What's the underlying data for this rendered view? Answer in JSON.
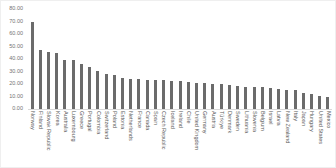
{
  "chart_data": {
    "type": "bar",
    "title": "",
    "xlabel": "",
    "ylabel": "",
    "ylim": [
      0,
      80
    ],
    "ytick_step": 10,
    "ytick_labels": [
      "0.00",
      "10.00",
      "20.00",
      "30.00",
      "40.00",
      "50.00",
      "60.00",
      "70.00",
      "80.00"
    ],
    "grid": false,
    "legend": false,
    "bar_color": "#6b6b6b",
    "axis_tick_color": "#737373",
    "category_label_color": "#595959",
    "categories": [
      "Norway",
      "Finland",
      "Slovak Republic",
      "Korea",
      "Australia",
      "Luxembourg",
      "Greece",
      "Portugal",
      "Colombia",
      "Switzerland",
      "Poland",
      "Estonia",
      "Netherlands",
      "France",
      "Canada",
      "Spain",
      "Czech Republic",
      "Iceland",
      "Ireland",
      "Chile",
      "United Kingdom",
      "Germany",
      "Austria",
      "Türkiye",
      "Denmark",
      "Sweden",
      "Lithuania",
      "Slovenia",
      "Belgium",
      "Israel",
      "Latvia",
      "New Zealand",
      "Italy",
      "Japan",
      "Hungary",
      "United States",
      "Mexico"
    ],
    "values": [
      69.5,
      47.3,
      45.7,
      44.8,
      39.6,
      39.2,
      35.8,
      33.6,
      30.4,
      28.0,
      27.3,
      25.1,
      24.3,
      24.2,
      23.6,
      23.3,
      23.0,
      22.4,
      22.2,
      21.6,
      21.1,
      20.6,
      20.3,
      20.0,
      19.2,
      18.6,
      17.8,
      17.6,
      17.4,
      17.0,
      16.2,
      15.2,
      15.0,
      13.0,
      11.8,
      10.5,
      9.8
    ]
  }
}
